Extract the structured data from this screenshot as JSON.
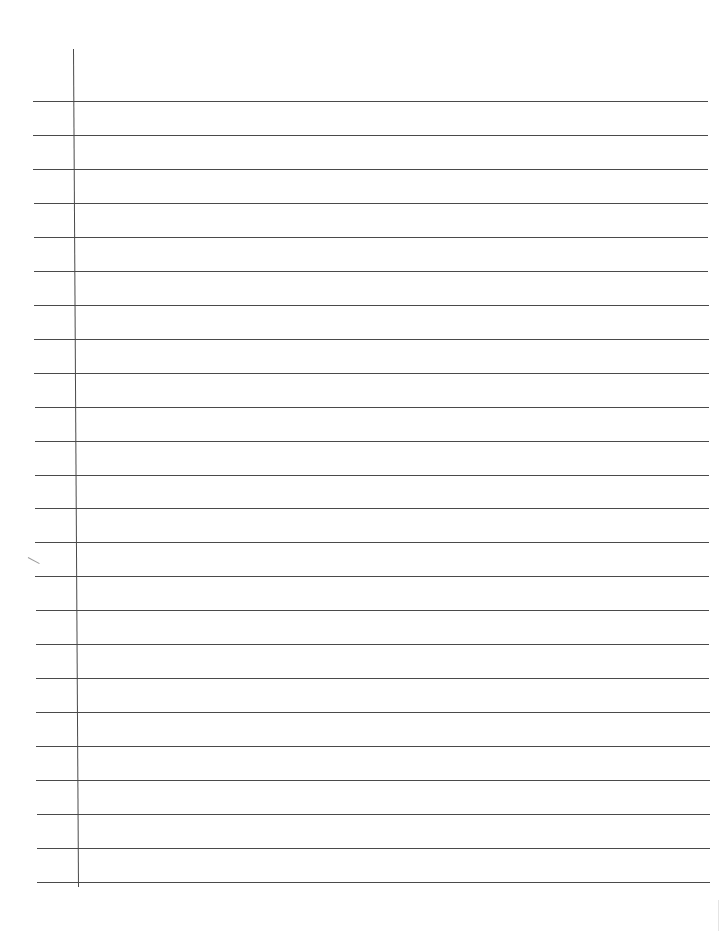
{
  "document": {
    "type": "lined-paper",
    "colors": {
      "background": "#ffffff",
      "rule": "#4a4a4a"
    },
    "rules": {
      "count": 24,
      "first_y": 101,
      "spacing": 34,
      "left_x_top": 33,
      "left_x_bottom": 37,
      "right_x": 708
    },
    "margin_line": {
      "x_top": 73,
      "y_top": 49,
      "x_bottom": 78,
      "y_bottom": 887
    },
    "text": ""
  }
}
